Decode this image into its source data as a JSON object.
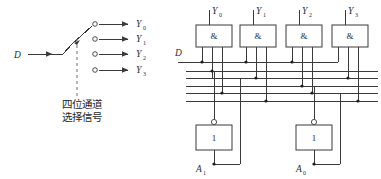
{
  "figure": {
    "background_color": "#ffffff",
    "line_color": "#3a3a3a"
  },
  "left_panel": {
    "input_label": "D",
    "switch_caption_line1": "四位通道",
    "switch_caption_line2": "选择信号",
    "outputs": [
      {
        "base": "Y",
        "sub": "0"
      },
      {
        "base": "Y",
        "sub": "1"
      },
      {
        "base": "Y",
        "sub": "2"
      },
      {
        "base": "Y",
        "sub": "3"
      }
    ]
  },
  "right_panel": {
    "input_label": "D",
    "and_gate_symbol": "&",
    "not_gate_symbol": "1",
    "and_gates": [
      {
        "output": {
          "base": "Y",
          "sub": "0"
        }
      },
      {
        "output": {
          "base": "Y",
          "sub": "1"
        }
      },
      {
        "output": {
          "base": "Y",
          "sub": "2"
        }
      },
      {
        "output": {
          "base": "Y",
          "sub": "3"
        }
      }
    ],
    "not_gates": [
      {
        "input": {
          "base": "A",
          "sub": "1"
        }
      },
      {
        "input": {
          "base": "A",
          "sub": "0"
        }
      }
    ],
    "select_inputs": [
      {
        "base": "A",
        "sub": "1"
      },
      {
        "base": "A",
        "sub": "0"
      }
    ]
  }
}
